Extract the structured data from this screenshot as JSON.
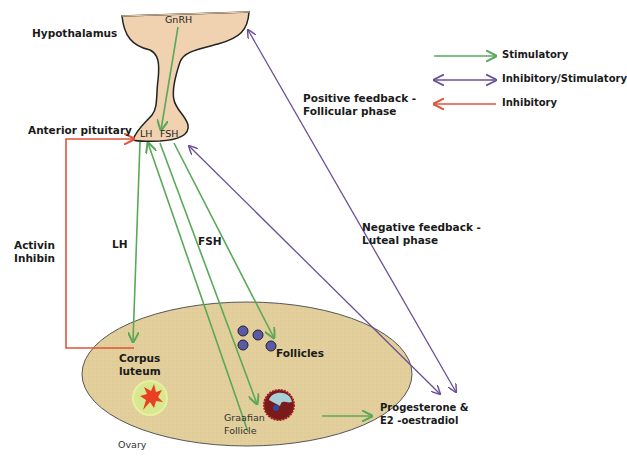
{
  "labels": {
    "hypothalamus": "Hypothalamus",
    "gnrh": "GnRH",
    "anterior_pituitary": "Anterior pituitary",
    "lh_pituitary": "LH",
    "fsh_pituitary": "FSH",
    "activin_inhibin": [
      "Activin",
      "Inhibin"
    ],
    "lh_arrow": "LH",
    "fsh_arrow": "FSH",
    "positive_feedback": [
      "Positive feedback -",
      "Follicular phase"
    ],
    "negative_feedback": [
      "Negative feedback -",
      "Luteal phase"
    ],
    "corpus_luteum": [
      "Corpus",
      "luteum"
    ],
    "follicles": "Follicles",
    "graafian_follicle": [
      "Graafian",
      "Follicle"
    ],
    "ovary": "Ovary",
    "hormones": [
      "Progesterone &",
      "E2 -oestradiol"
    ]
  },
  "legend": [
    {
      "label": "Stimulatory",
      "type": "stimulatory",
      "color": "#5aa85a"
    },
    {
      "label": "Inhibitory/Stimulatory",
      "type": "bidirectional",
      "color": "#6b4f96"
    },
    {
      "label": "Inhibitory",
      "type": "inhibitory",
      "color": "#e0533a"
    }
  ],
  "colors": {
    "gland_fill": "#f0d2b0",
    "ovary_fill": "#e2cf9c",
    "stimulatory": "#5aa85a",
    "bidirectional": "#6b4f96",
    "inhibitory": "#e0533a"
  }
}
